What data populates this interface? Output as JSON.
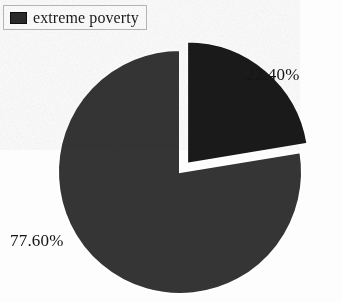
{
  "legend": {
    "swatch_color": "#2b2b2b",
    "label": "extreme poverty"
  },
  "labels": {
    "major": "77.60%",
    "minor": "22.40%"
  },
  "chart_data": {
    "type": "pie",
    "title": "",
    "subtitle": "",
    "xlabel": "",
    "ylabel": "",
    "legend_position": "top-left",
    "legend_entries": [
      "extreme poverty"
    ],
    "categories": [
      "77.60%",
      "22.40%"
    ],
    "values": [
      77.6,
      22.4
    ],
    "value_labels": [
      "77.60%",
      "22.40%"
    ],
    "units": "percent",
    "total": 100,
    "slices": [
      {
        "label": "77.60%",
        "value": 77.6,
        "color": "#353535",
        "exploded": false,
        "start_angle_deg": 80.64,
        "end_angle_deg": 360.0
      },
      {
        "label": "22.40%",
        "value": 22.4,
        "color": "#1a1a1a",
        "exploded": true,
        "explode_offset_px": 11,
        "start_angle_deg": 0.0,
        "end_angle_deg": 80.64
      }
    ],
    "geometry": {
      "center_x": 180,
      "center_y": 172,
      "radius": 122,
      "gap_color": "#ffffff"
    },
    "colors": {
      "major_slice": "#353535",
      "minor_slice": "#1a1a1a",
      "background": "#fdfdfd",
      "label_text": "#151515"
    },
    "grid": false
  }
}
